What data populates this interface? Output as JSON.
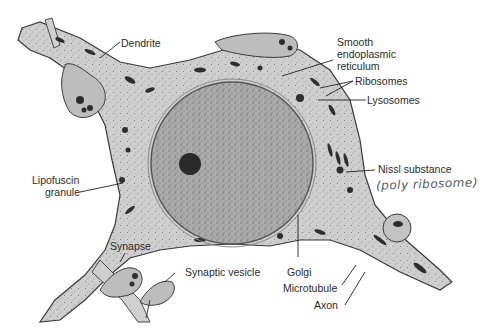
{
  "figure": {
    "colors": {
      "background": "#ffffff",
      "cytoplasm": "#cfcfcf",
      "nucleus": "#a9a9a9",
      "nucleolus": "#2a2a2a",
      "organelle": "#2e2e2e",
      "membrane": "#3a3a3a",
      "label_text": "#2b2b2b",
      "handwriting": "#555a66"
    }
  },
  "labels": {
    "dendrite": "Dendrite",
    "ser_1": "Smooth",
    "ser_2": "endoplasmic",
    "ser_3": "reticulum",
    "ribosomes": "Ribosomes",
    "lysosomes": "Lysosomes",
    "lipofuscin_1": "Lipofuscin",
    "lipofuscin_2": "granule",
    "nissl": "Nissl substance",
    "nissl_note": "(poly ribosome)",
    "synapse": "Synapse",
    "synaptic_vesicle": "Synaptic vesicle",
    "golgi": "Golgi",
    "microtubule": "Microtubule",
    "axon": "Axon"
  }
}
